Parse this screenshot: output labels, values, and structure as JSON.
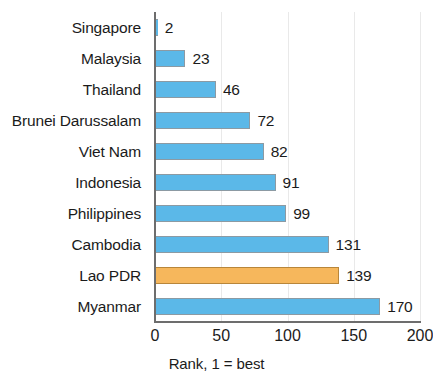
{
  "chart_data": {
    "type": "bar",
    "orientation": "horizontal",
    "title": "",
    "xlabel": "Rank, 1 = best",
    "ylabel": "",
    "xlim": [
      0,
      200
    ],
    "xticks": [
      0,
      50,
      100,
      150,
      200
    ],
    "xtick_labels": [
      "0",
      "50",
      "100",
      "150",
      "200"
    ],
    "grid": true,
    "grid_axis": "x",
    "legend": false,
    "categories": [
      "Singapore",
      "Malaysia",
      "Thailand",
      "Brunei Darussalam",
      "Viet Nam",
      "Indonesia",
      "Philippines",
      "Cambodia",
      "Lao PDR",
      "Myanmar"
    ],
    "values": [
      2,
      23,
      46,
      72,
      82,
      91,
      99,
      131,
      139,
      170
    ],
    "value_labels": [
      "2",
      "23",
      "46",
      "72",
      "82",
      "91",
      "99",
      "131",
      "139",
      "170"
    ],
    "bar_colors": [
      "#5bb8e8",
      "#5bb8e8",
      "#5bb8e8",
      "#5bb8e8",
      "#5bb8e8",
      "#5bb8e8",
      "#5bb8e8",
      "#5bb8e8",
      "#f6b75c",
      "#5bb8e8"
    ],
    "highlighted_category": "Lao PDR",
    "colors": {
      "series_default": "#5bb8e8",
      "series_highlight": "#f6b75c",
      "bar_outline": "#8c9aa3",
      "axis": "#6d6d6d",
      "grid": "#e9e9e9",
      "text": "#1b1b1b",
      "background": "#ffffff"
    }
  }
}
